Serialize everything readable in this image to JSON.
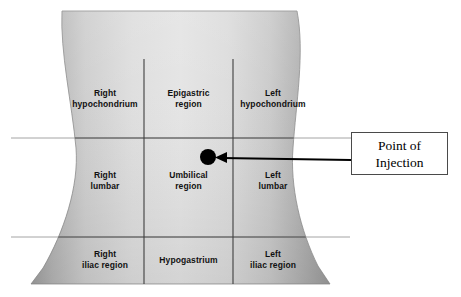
{
  "diagram": {
    "torso": {
      "fill_light": "#e3e3e3",
      "fill_mid": "#c9c9c9",
      "fill_dark": "#9a9a9a",
      "edge_color": "#8d8d8d"
    },
    "grid": {
      "line_color": "#5a5a5a",
      "extended_line_color": "#9a9a9a",
      "vertical_left_x": 144,
      "vertical_right_x": 233,
      "horizontal_upper_y": 138,
      "horizontal_lower_y": 237
    },
    "regions": [
      {
        "id": "right-hypochondrium",
        "label": "Right\nhypochondrium",
        "row": 0,
        "col": 0,
        "x": 66,
        "y": 88,
        "w": 78
      },
      {
        "id": "epigastric-region",
        "label": "Epigastric\nregion",
        "row": 0,
        "col": 1,
        "x": 149,
        "y": 88,
        "w": 79
      },
      {
        "id": "left-hypochondrium",
        "label": "Left\nhypochondrium",
        "row": 0,
        "col": 2,
        "x": 234,
        "y": 88,
        "w": 78
      },
      {
        "id": "right-lumbar",
        "label": "Right\nlumbar",
        "row": 1,
        "col": 0,
        "x": 66,
        "y": 170,
        "w": 78
      },
      {
        "id": "umbilical-region",
        "label": "Umbilical\nregion",
        "row": 1,
        "col": 1,
        "x": 149,
        "y": 170,
        "w": 79
      },
      {
        "id": "left-lumbar",
        "label": "Left\nlumbar",
        "row": 1,
        "col": 2,
        "x": 234,
        "y": 170,
        "w": 78
      },
      {
        "id": "right-iliac-region",
        "label": "Right\niliac region",
        "row": 2,
        "col": 0,
        "x": 66,
        "y": 249,
        "w": 78
      },
      {
        "id": "hypogastrium",
        "label": "Hypogastrium",
        "row": 2,
        "col": 1,
        "x": 149,
        "y": 255,
        "w": 79
      },
      {
        "id": "left-iliac-region",
        "label": "Left\niliac region",
        "row": 2,
        "col": 2,
        "x": 234,
        "y": 249,
        "w": 78
      }
    ],
    "injection_point": {
      "label": "Point of\nInjection",
      "dot_color": "#000000",
      "dot_center_x": 208,
      "dot_center_y": 157,
      "dot_radius": 8,
      "arrow_color": "#000000",
      "arrow_from_x": 351,
      "arrow_from_y": 160,
      "arrow_to_x": 217,
      "arrow_to_y": 158,
      "box_border_color": "#4a4a4a"
    }
  }
}
